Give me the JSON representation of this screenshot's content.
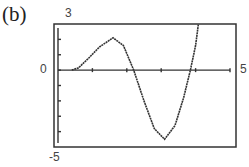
{
  "panel_label": "(b)",
  "chart_data": {
    "type": "line",
    "title": "",
    "xlabel": "",
    "ylabel": "",
    "xlim": [
      0,
      5
    ],
    "ylim": [
      -5,
      3
    ],
    "x_tick_labels": {
      "min": "0",
      "max": "5"
    },
    "y_tick_labels": {
      "max": "3",
      "min": "-5"
    },
    "x_ticks": [
      1,
      2,
      3,
      4,
      5
    ],
    "y_ticks": [
      -5,
      -4,
      -3,
      -2,
      -1,
      0,
      1,
      2,
      3
    ],
    "grid": false,
    "series": [
      {
        "name": "f(x)",
        "x": [
          0.4,
          0.6,
          0.9,
          1.2,
          1.6,
          1.9,
          2.2,
          2.5,
          2.8,
          3.1,
          3.4,
          3.65,
          3.85,
          4.0,
          4.08
        ],
        "y": [
          0,
          0.15,
          0.8,
          1.5,
          2.1,
          1.6,
          0,
          -2.0,
          -3.8,
          -4.5,
          -3.6,
          -1.8,
          0,
          1.6,
          3
        ]
      }
    ]
  }
}
